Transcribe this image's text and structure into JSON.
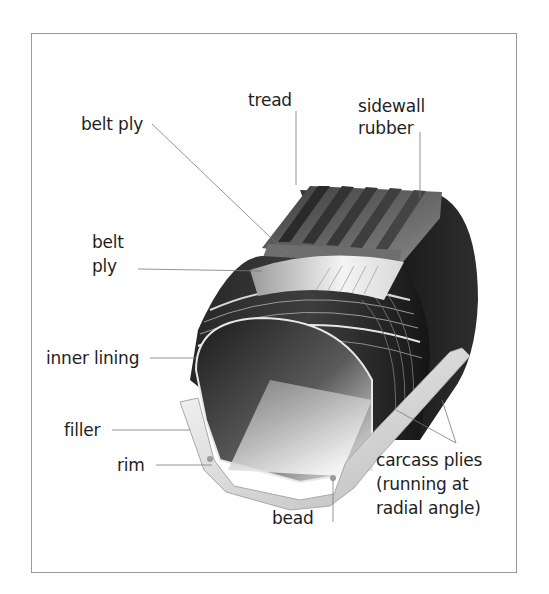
{
  "diagram": {
    "colors": {
      "frame_border": "#9a9a9a",
      "leader_line": "#7a7a7a",
      "text": "#1e1e1e",
      "rubber_dark": "#2a2a2a",
      "tread_mid": "#6a6a6a",
      "belt_light": "#e8e8e8"
    },
    "labels": {
      "tread": "tread",
      "sidewall_line1": "sidewall",
      "sidewall_line2": "rubber",
      "belt_ply_top": "belt ply",
      "belt_ply_mid_line1": "belt",
      "belt_ply_mid_line2": "ply",
      "inner_lining": "inner lining",
      "filler": "filler",
      "rim": "rim",
      "bead": "bead",
      "carcass_line1": "carcass plies",
      "carcass_line2": "(running at",
      "carcass_line3": "radial angle)"
    }
  }
}
